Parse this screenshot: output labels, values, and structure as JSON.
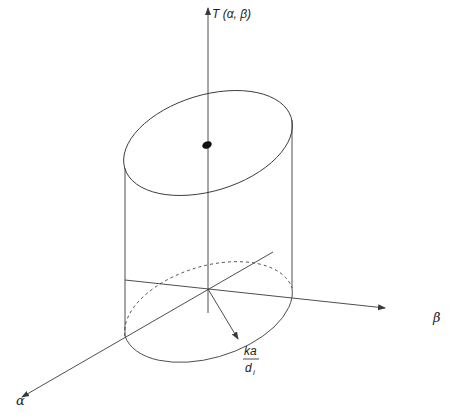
{
  "diagram": {
    "type": "3d-cylinder-plot",
    "labels": {
      "vertical_axis": "T (α, β)",
      "horizontal_axis_right": "β",
      "horizontal_axis_front": "α",
      "radius_numerator": "ka",
      "radius_denominator": "d",
      "radius_denominator_subscript": "i"
    },
    "elements": [
      "vertical-axis",
      "alpha-axis",
      "beta-axis",
      "top-ellipse",
      "bottom-ellipse-front",
      "bottom-ellipse-back-dashed",
      "cylinder-left-edge",
      "cylinder-right-edge",
      "radius-arrow",
      "center-dot"
    ],
    "colors": {
      "stroke": "#3a3a3a",
      "text": "#222222",
      "background": "#ffffff"
    }
  }
}
